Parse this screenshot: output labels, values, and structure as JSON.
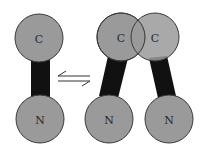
{
  "diagram": {
    "colors": {
      "domain_fill": "#9a9a9a",
      "domain_stroke": "#3a3a3a",
      "linker_fill": "#111111",
      "arrow_stroke": "#333333",
      "background": "#ffffff"
    },
    "left_state": {
      "domains": [
        {
          "label": "C",
          "cx": 39,
          "cy": 38,
          "r": 24
        },
        {
          "label": "N",
          "cx": 40,
          "cy": 119,
          "r": 24
        }
      ],
      "linker": {
        "points": "31,58 50,58 50,98 31,98"
      }
    },
    "equilibrium_arrows": {
      "top_arrow_direction": "left",
      "bottom_arrow_direction": "right"
    },
    "right_state": {
      "domains": [
        {
          "label": "C",
          "cx": 121,
          "cy": 37,
          "r": 24
        },
        {
          "label": "C",
          "cx": 155,
          "cy": 37,
          "r": 24
        },
        {
          "label": "N",
          "cx": 109,
          "cy": 119,
          "r": 24
        },
        {
          "label": "N",
          "cx": 169,
          "cy": 119,
          "r": 24
        }
      ],
      "linkers": [
        {
          "points": "108,56 128,58 118,98 99,96"
        },
        {
          "points": "149,58 167,56 176,96 158,98"
        }
      ]
    }
  }
}
